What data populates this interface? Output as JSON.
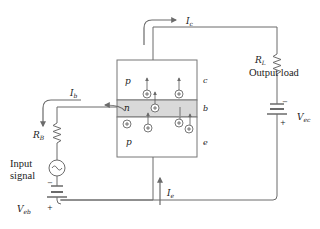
{
  "figure": {
    "type": "pnp-transistor-amplifier-circuit",
    "colors": {
      "wire": "#6b6b6b",
      "box_border": "#777777",
      "n_region_fill": "#d9d9d9",
      "text": "#222222",
      "background": "#ffffff"
    }
  },
  "transistor": {
    "regions": [
      {
        "label": "p",
        "terminal": "c",
        "position": "top"
      },
      {
        "label": "n",
        "terminal": "b",
        "position": "middle"
      },
      {
        "label": "p",
        "terminal": "e",
        "position": "bottom"
      }
    ],
    "carrier_symbol": "+",
    "carrier_icon": "hole-plus-circle-icon"
  },
  "labels": {
    "collector_current": "I",
    "collector_current_sub": "c",
    "base_current": "I",
    "base_current_sub": "b",
    "emitter_current": "I",
    "emitter_current_sub": "e",
    "load_resistor": "R",
    "load_resistor_sub": "L",
    "load_text": "Output load",
    "base_resistor": "R",
    "base_resistor_sub": "B",
    "input_text_line1": "Input",
    "input_text_line2": "signal",
    "collector_supply": "V",
    "collector_supply_sub": "ec",
    "base_supply": "V",
    "base_supply_sub": "eb",
    "p_top": "p",
    "n_mid": "n",
    "p_bottom": "p",
    "term_c": "c",
    "term_b": "b",
    "term_e": "e",
    "battery_minus": "−",
    "battery_plus": "+"
  }
}
